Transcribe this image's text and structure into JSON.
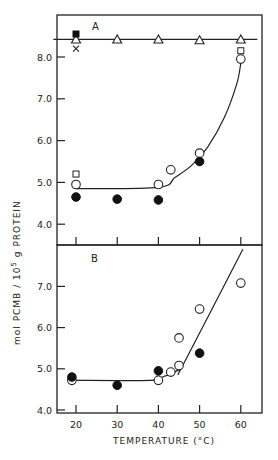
{
  "chart_data": [
    {
      "type": "scatter",
      "panel": "A",
      "panel_label": "A",
      "xlabel": "TEMPERATURE (°C)",
      "ylabel": "mol PCMB / 10^5 g PROTEIN",
      "xlim": [
        15,
        65
      ],
      "ylim": [
        3.9,
        8.95
      ],
      "xticks": [
        20,
        30,
        40,
        50,
        60
      ],
      "yticks": [
        4.0,
        5.0,
        6.0,
        7.0,
        8.0
      ],
      "ytick_labels": [
        "4.0",
        "5.0",
        "6.0",
        "7.0",
        "8.0"
      ],
      "grid": false,
      "series": [
        {
          "name": "open triangles",
          "marker": "triangle-open",
          "x": [
            20,
            30,
            40,
            50,
            60
          ],
          "y": [
            8.42,
            8.42,
            8.42,
            8.4,
            8.42
          ]
        },
        {
          "name": "filled square",
          "marker": "square-filled",
          "x": [
            20
          ],
          "y": [
            8.55
          ]
        },
        {
          "name": "cross",
          "marker": "x",
          "x": [
            20
          ],
          "y": [
            8.2
          ]
        },
        {
          "name": "open squares",
          "marker": "square-open",
          "x": [
            20,
            60
          ],
          "y": [
            5.2,
            8.15
          ]
        },
        {
          "name": "open circles",
          "marker": "circle-open",
          "x": [
            20,
            40,
            43,
            50,
            60
          ],
          "y": [
            4.95,
            4.95,
            5.3,
            5.7,
            7.95
          ]
        },
        {
          "name": "filled circles",
          "marker": "circle-filled",
          "x": [
            20,
            30,
            40,
            50
          ],
          "y": [
            4.65,
            4.6,
            4.58,
            5.5
          ]
        }
      ],
      "fit_lines": [
        {
          "name": "plateau line",
          "x": [
            14.5,
            64
          ],
          "y": [
            8.42,
            8.42
          ]
        },
        {
          "name": "curve",
          "x": [
            20,
            40,
            44,
            48,
            52,
            56,
            59,
            60
          ],
          "y": [
            4.85,
            4.88,
            5.12,
            5.4,
            5.85,
            6.55,
            7.35,
            7.85
          ]
        }
      ]
    },
    {
      "type": "scatter",
      "panel": "B",
      "panel_label": "B",
      "xlabel": "TEMPERATURE (°C)",
      "ylabel": "mol PCMB / 10^5 g PROTEIN",
      "xlim": [
        15,
        65
      ],
      "ylim": [
        4.0,
        8.04
      ],
      "xticks": [
        20,
        30,
        40,
        50,
        60
      ],
      "xtick_labels": [
        "20",
        "30",
        "40",
        "50",
        "60"
      ],
      "yticks": [
        4.0,
        5.0,
        6.0,
        7.0
      ],
      "ytick_labels": [
        "4.0",
        "5.0",
        "6.0",
        "7.0"
      ],
      "grid": false,
      "series": [
        {
          "name": "open circles",
          "marker": "circle-open",
          "x": [
            19,
            40,
            43,
            45,
            45,
            50,
            60
          ],
          "y": [
            4.72,
            4.72,
            4.92,
            5.08,
            5.75,
            6.45,
            7.08
          ]
        },
        {
          "name": "filled circles",
          "marker": "circle-filled",
          "x": [
            19,
            30,
            40,
            50
          ],
          "y": [
            4.8,
            4.6,
            4.95,
            5.38
          ]
        }
      ],
      "fit_lines": [
        {
          "name": "plateau then rise",
          "x": [
            19,
            38,
            41,
            45,
            46,
            60.5
          ],
          "y": [
            4.72,
            4.72,
            4.8,
            4.98,
            5.1,
            7.9
          ]
        }
      ]
    }
  ],
  "labels": {
    "panel_a": "A",
    "panel_b": "B",
    "x_axis_title": "TEMPERATURE (°C)",
    "y_axis_title_pre": "mol PCMB / 10",
    "y_axis_title_sup": "5",
    "y_axis_title_post": " g PROTEIN"
  }
}
